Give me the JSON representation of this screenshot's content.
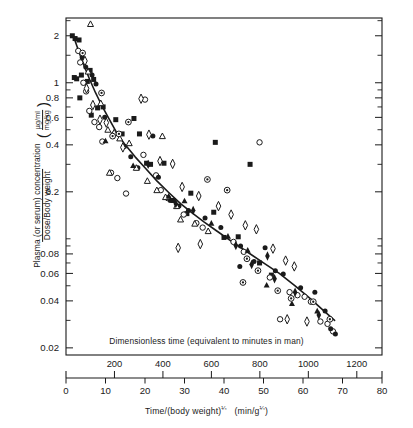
{
  "figure": {
    "y_axis_label_main": "Plasma (or serum) concentration",
    "y_axis_label_den": "Dose/Body weight",
    "y_axis_unit_num": "µg/ml",
    "y_axis_unit_den": "mg/kg",
    "x_axis_label": "Time/(body weight)",
    "x_axis_label_exp": "¼",
    "x_axis_unit_open": "(min/g",
    "x_axis_unit_exp": "¼",
    "x_axis_unit_close": ")",
    "secondary_axis_caption": "Dimensionless time (equivalent to minutes in man)",
    "ink_color": "#1a1a1a",
    "background": "#ffffff"
  },
  "chart_data": {
    "type": "scatter",
    "title": "",
    "xlabel": "Time/(body weight)^1/4  (min/g^1/4)",
    "ylabel": "Plasma (or serum) concentration / Dose/Body weight (µg/ml per mg/kg)",
    "yscale": "log",
    "xscale": "linear",
    "xlim": [
      0,
      80
    ],
    "ylim": [
      0.018,
      2.6
    ],
    "grid": false,
    "legend": "none",
    "x_ticks": [
      0,
      10,
      20,
      30,
      40,
      50,
      60,
      70,
      80
    ],
    "x_tick_labels": [
      "0",
      "10",
      "20",
      "30",
      "40",
      "50",
      "60",
      "70",
      "80"
    ],
    "y_ticks": [
      0.02,
      0.04,
      0.06,
      0.08,
      0.2,
      0.4,
      0.6,
      0.8,
      1,
      2
    ],
    "y_tick_labels": [
      "0.02",
      "0.04",
      "0.06",
      "0.08",
      "0.2",
      "0.4",
      "0.6",
      "0.8",
      "1",
      "2"
    ],
    "y_minor_ticks": [
      0.03,
      0.05,
      0.07,
      0.09,
      0.1,
      0.3,
      0.5,
      0.7,
      0.9,
      1.5,
      2.5
    ],
    "secondary_x_ticks": [
      200,
      400,
      600,
      800,
      1000,
      1200
    ],
    "secondary_x_tick_labels": [
      "200",
      "400",
      "600",
      "800",
      "1000",
      "1200"
    ],
    "secondary_x_scale_factor": 16.3,
    "fit_curve": {
      "name": "allometric fit",
      "x": [
        2.0,
        3.2,
        4.5,
        6.0,
        7.5,
        9.0,
        11.0,
        13.0,
        15.0,
        17.5,
        20.0,
        23.0,
        26.0,
        29.0,
        32.0,
        35.0,
        38.0,
        42.0,
        46.0,
        50.0,
        54.0,
        58.0,
        62.0,
        65.0,
        68.0
      ],
      "y": [
        1.95,
        1.6,
        1.3,
        1.05,
        0.86,
        0.72,
        0.58,
        0.47,
        0.4,
        0.335,
        0.285,
        0.235,
        0.198,
        0.168,
        0.146,
        0.128,
        0.113,
        0.096,
        0.082,
        0.07,
        0.06,
        0.05,
        0.041,
        0.035,
        0.03
      ]
    },
    "series": [
      {
        "name": "filled-square",
        "marker": "filled-square",
        "points": [
          [
            1.6,
            2.0
          ],
          [
            2.3,
            1.92
          ],
          [
            3.3,
            1.88
          ],
          [
            2.1,
            1.08
          ],
          [
            2.7,
            1.06
          ],
          [
            3.9,
            1.12
          ],
          [
            4.6,
            1.0
          ],
          [
            5.4,
            1.02
          ],
          [
            3.5,
            0.8
          ],
          [
            6.1,
            1.2
          ],
          [
            7.0,
            1.05
          ],
          [
            6.4,
            0.62
          ],
          [
            8.0,
            0.69
          ],
          [
            9.4,
            0.7
          ],
          [
            12.6,
            0.58
          ],
          [
            14.2,
            0.47
          ],
          [
            17.2,
            0.59
          ],
          [
            18.6,
            0.47
          ],
          [
            20.4,
            0.305
          ],
          [
            21.4,
            0.3
          ],
          [
            24.8,
            0.305
          ],
          [
            27.2,
            0.176
          ],
          [
            30.6,
            0.145
          ],
          [
            31.6,
            0.196
          ],
          [
            37.4,
            0.148
          ],
          [
            40.0,
            0.102
          ],
          [
            43.6,
            0.103
          ],
          [
            49.0,
            0.07
          ],
          [
            52.0,
            0.0585
          ],
          [
            37.8,
            0.415
          ],
          [
            46.6,
            0.3
          ]
        ]
      },
      {
        "name": "open-circle",
        "marker": "open-circle",
        "points": [
          [
            3.1,
            1.6
          ],
          [
            3.6,
            1.35
          ],
          [
            4.4,
            1.0
          ],
          [
            5.1,
            0.88
          ],
          [
            5.9,
            0.66
          ],
          [
            7.2,
            0.56
          ],
          [
            8.4,
            0.52
          ],
          [
            9.2,
            0.42
          ],
          [
            11.4,
            0.265
          ],
          [
            13.0,
            0.245
          ],
          [
            15.2,
            0.195
          ],
          [
            19.6,
            0.345
          ],
          [
            22.8,
            0.255
          ],
          [
            24.0,
            0.205
          ],
          [
            25.8,
            0.182
          ],
          [
            20.0,
            0.78
          ],
          [
            29.8,
            0.143
          ],
          [
            33.0,
            0.126
          ],
          [
            34.6,
            0.118
          ],
          [
            42.4,
            0.0955
          ],
          [
            45.0,
            0.0825
          ],
          [
            51.6,
            0.0565
          ],
          [
            56.6,
            0.0455
          ],
          [
            58.6,
            0.0435
          ],
          [
            60.4,
            0.0425
          ],
          [
            62.0,
            0.0395
          ],
          [
            64.4,
            0.0295
          ],
          [
            66.2,
            0.0285
          ],
          [
            67.6,
            0.0255
          ],
          [
            54.2,
            0.0305
          ],
          [
            49.0,
            0.415
          ]
        ]
      },
      {
        "name": "filled-circle",
        "marker": "filled-circle",
        "points": [
          [
            4.1,
            1.45
          ],
          [
            5.0,
            1.26
          ],
          [
            6.6,
            1.12
          ],
          [
            7.6,
            0.98
          ],
          [
            9.8,
            0.6
          ],
          [
            12.0,
            0.47
          ],
          [
            14.8,
            0.39
          ],
          [
            16.4,
            0.335
          ],
          [
            18.2,
            0.285
          ],
          [
            23.4,
            0.248
          ],
          [
            26.4,
            0.176
          ],
          [
            28.6,
            0.162
          ],
          [
            31.0,
            0.152
          ],
          [
            35.2,
            0.136
          ],
          [
            39.2,
            0.118
          ],
          [
            44.2,
            0.09
          ],
          [
            47.6,
            0.0715
          ],
          [
            53.0,
            0.0625
          ],
          [
            55.0,
            0.0595
          ],
          [
            59.4,
            0.0485
          ],
          [
            63.0,
            0.0455
          ],
          [
            65.6,
            0.0345
          ],
          [
            67.0,
            0.0265
          ],
          [
            68.2,
            0.0245
          ],
          [
            22.0,
            0.455
          ],
          [
            50.4,
            0.0875
          ],
          [
            44.0,
            0.0665
          ]
        ]
      },
      {
        "name": "open-triangle",
        "marker": "open-triangle",
        "points": [
          [
            6.2,
            2.38
          ],
          [
            5.6,
            1.18
          ],
          [
            8.8,
            0.74
          ],
          [
            10.6,
            0.5
          ],
          [
            13.6,
            0.44
          ],
          [
            16.0,
            0.41
          ],
          [
            17.8,
            0.285
          ],
          [
            20.6,
            0.235
          ],
          [
            23.0,
            0.205
          ],
          [
            25.2,
            0.185
          ],
          [
            28.0,
            0.162
          ],
          [
            29.0,
            0.133
          ],
          [
            32.6,
            0.125
          ],
          [
            36.0,
            0.112
          ],
          [
            11.0,
            0.265
          ],
          [
            24.4,
            0.455
          ]
        ]
      },
      {
        "name": "filled-triangle",
        "marker": "filled-triangle",
        "points": [
          [
            10.0,
            0.425
          ],
          [
            17.0,
            0.295
          ],
          [
            26.0,
            0.188
          ],
          [
            30.0,
            0.175
          ],
          [
            36.8,
            0.126
          ],
          [
            41.0,
            0.104
          ],
          [
            46.0,
            0.0845
          ],
          [
            50.8,
            0.0505
          ],
          [
            57.2,
            0.0385
          ],
          [
            63.6,
            0.0345
          ]
        ]
      },
      {
        "name": "open-diamond",
        "marker": "open-diamond",
        "points": [
          [
            4.8,
            1.38
          ],
          [
            5.2,
            0.92
          ],
          [
            6.8,
            0.72
          ],
          [
            8.6,
            0.58
          ],
          [
            10.2,
            0.555
          ],
          [
            12.2,
            0.47
          ],
          [
            14.4,
            0.385
          ],
          [
            19.0,
            0.79
          ],
          [
            21.0,
            0.465
          ],
          [
            23.8,
            0.315
          ],
          [
            27.0,
            0.302
          ],
          [
            29.4,
            0.215
          ],
          [
            33.6,
            0.188
          ],
          [
            38.6,
            0.162
          ],
          [
            41.8,
            0.143
          ],
          [
            28.4,
            0.0875
          ],
          [
            34.0,
            0.0925
          ],
          [
            48.2,
            0.115
          ],
          [
            52.4,
            0.0865
          ],
          [
            55.6,
            0.0725
          ],
          [
            57.8,
            0.0665
          ],
          [
            56.0,
            0.0305
          ],
          [
            61.0,
            0.0295
          ],
          [
            45.4,
            0.122
          ]
        ]
      },
      {
        "name": "dotted-circle",
        "marker": "dotted-circle",
        "points": [
          [
            4.2,
            1.55
          ],
          [
            9.0,
            0.86
          ],
          [
            11.8,
            0.455
          ],
          [
            15.8,
            0.56
          ],
          [
            13.4,
            0.47
          ],
          [
            35.8,
            0.24
          ],
          [
            40.8,
            0.205
          ],
          [
            45.8,
            0.0745
          ],
          [
            48.6,
            0.0625
          ],
          [
            53.6,
            0.0465
          ],
          [
            57.0,
            0.0415
          ],
          [
            62.6,
            0.0395
          ],
          [
            66.8,
            0.0305
          ],
          [
            44.8,
            0.0525
          ]
        ]
      },
      {
        "name": "filled-diamond",
        "marker": "filled-diamond",
        "points": [
          [
            20.8,
            0.3
          ],
          [
            27.8,
            0.168
          ],
          [
            32.2,
            0.152
          ],
          [
            43.0,
            0.0905
          ],
          [
            47.0,
            0.0685
          ],
          [
            52.8,
            0.0555
          ],
          [
            58.0,
            0.0455
          ],
          [
            64.0,
            0.0325
          ],
          [
            51.0,
            0.0775
          ]
        ]
      }
    ]
  }
}
